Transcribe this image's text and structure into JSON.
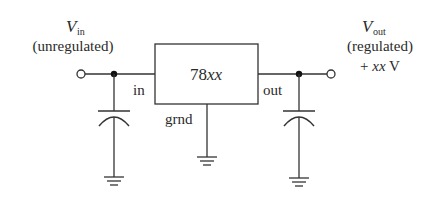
{
  "diagram": {
    "regulator": {
      "label_prefix": "78",
      "label_suffix": "xx"
    },
    "pins": {
      "in": "in",
      "out": "out",
      "ground": "grnd"
    },
    "input": {
      "symbol": "V",
      "subscript": "in",
      "description": "(unregulated)"
    },
    "output": {
      "symbol": "V",
      "subscript": "out",
      "description": "(regulated)",
      "voltage_prefix": "+ ",
      "voltage_value": "xx",
      "voltage_unit": " V"
    },
    "components": [
      {
        "type": "input-terminal"
      },
      {
        "type": "input-junction"
      },
      {
        "type": "input-capacitor"
      },
      {
        "type": "regulator-ic"
      },
      {
        "type": "output-junction"
      },
      {
        "type": "output-capacitor"
      },
      {
        "type": "output-terminal"
      },
      {
        "type": "ground",
        "count": 3
      }
    ],
    "colors": {
      "line": "#333333",
      "text": "#2a2a2a",
      "background": "#ffffff"
    }
  }
}
